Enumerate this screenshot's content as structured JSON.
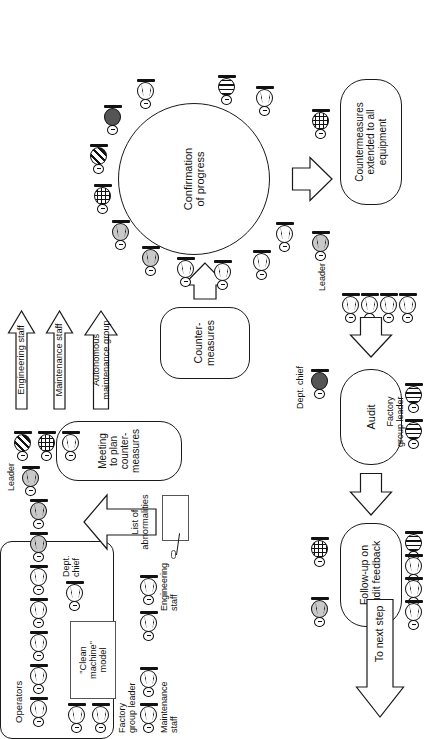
{
  "figure": {
    "type": "flow-diagram",
    "orientation": "rotated-90-ccw",
    "caption": ""
  },
  "nodes": {
    "meeting": "Meeting\nto plan\ncounter-\nmeasures",
    "countermeasures": "Counter-\nmeasures",
    "confirmation": "Confirmation\nof progress",
    "extended": "Countermeasures\nextended to all\nequipment",
    "audit": "Audit",
    "followup": "Follow-up on\naudit feedback",
    "clean_machine": "\"Clean\nmachine\"\nmodel"
  },
  "arrows": {
    "engineering_staff": "Engineering staff",
    "maintenance_staff": "Maintenance staff",
    "autonomous_group": "Autonomous\nmaintenance group",
    "list_of_abnormalities": "List of\nabnormalities",
    "to_next_step": "To next step"
  },
  "labels": {
    "operators": "Operators",
    "leader_left": "Leader",
    "leader_right": "Leader",
    "dept_chief_left": "Dept.\nchief",
    "dept_chief_right": "Dept. chief",
    "factory_group_leader_left": "Factory\ngroup leader",
    "factory_group_leader_right": "Factory\ngroup leader",
    "engineering_staff_label": "Engineering\nstaff",
    "maintenance_staff_label": "Maintenance\nstaff"
  },
  "colors": {
    "ink": "#1a1a1a",
    "fill_white": "#ffffff",
    "fill_gray": "#c9c9c9",
    "fill_dark": "#555555"
  },
  "person_legend": {
    "white": "operator",
    "gray": "leader",
    "dark": "dept-chief",
    "grid": "engineering-staff",
    "diag": "maintenance-staff",
    "wave": "factory-group-leader"
  }
}
